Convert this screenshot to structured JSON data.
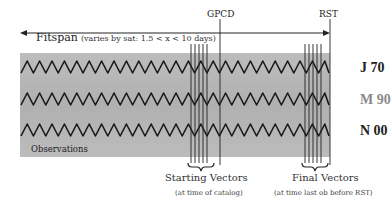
{
  "header": {
    "fitspan_main": "Fitspan",
    "fitspan_sub": "(varies by sat: 1.5 < x < 10 days)",
    "gpcd_label": "GPCD",
    "rst_label": "RST"
  },
  "rows": [
    {
      "label": "J 70",
      "color": "#222222"
    },
    {
      "label": "M 90",
      "color": "#8a8a8a"
    },
    {
      "label": "N 00",
      "color": "#222222"
    }
  ],
  "panel": {
    "label": "Observations",
    "fill": "#b4b4b4"
  },
  "vectors": {
    "starting": {
      "title": "Starting Vectors",
      "subtitle": "(at time of catalog)",
      "line_count": 5
    },
    "final": {
      "title": "Final Vectors",
      "subtitle": "(at time last ob before RST)",
      "line_count": 5
    }
  }
}
